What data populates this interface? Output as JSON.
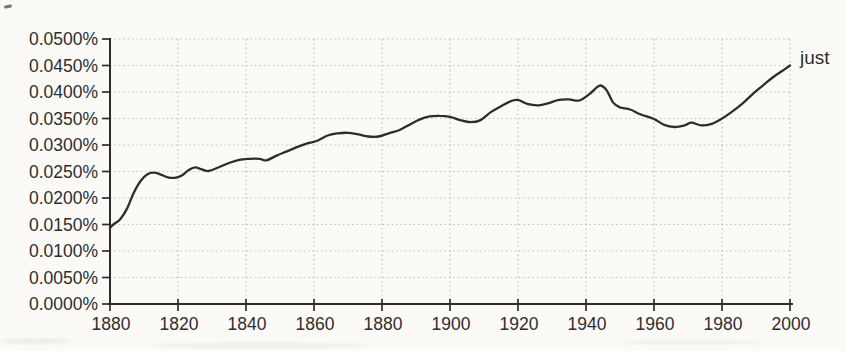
{
  "chart_data": {
    "type": "line",
    "title": "",
    "xlabel": "",
    "ylabel": "",
    "series_label": "just",
    "x_range": [
      1800,
      2000
    ],
    "y_range_percent": [
      0,
      0.05
    ],
    "grid": "dotted",
    "legend_position": "end-of-line-right",
    "x_tick_years": [
      1800,
      1820,
      1840,
      1860,
      1880,
      1900,
      1920,
      1940,
      1960,
      1980,
      2000
    ],
    "x_tick_labels": [
      "1880",
      "1820",
      "1840",
      "1860",
      "1880",
      "1900",
      "1920",
      "1940",
      "1960",
      "1980",
      "2000"
    ],
    "y_tick_values": [
      0.05,
      0.045,
      0.04,
      0.035,
      0.03,
      0.025,
      0.02,
      0.015,
      0.01,
      0.005,
      0.0
    ],
    "y_tick_labels": [
      "0.0500%",
      "0.0450%",
      "0.0400%",
      "0.0350%",
      "0.0300%",
      "0.0250%",
      "0.0200%",
      "0.0150%",
      "0.0100%",
      "0.0050%",
      "0.0000%"
    ],
    "series": [
      {
        "name": "just",
        "points": [
          [
            1800,
            0.0144
          ],
          [
            1801,
            0.015
          ],
          [
            1803,
            0.016
          ],
          [
            1805,
            0.018
          ],
          [
            1807,
            0.021
          ],
          [
            1809,
            0.0232
          ],
          [
            1811,
            0.0245
          ],
          [
            1813,
            0.0248
          ],
          [
            1815,
            0.0244
          ],
          [
            1817,
            0.0239
          ],
          [
            1819,
            0.0238
          ],
          [
            1821,
            0.0242
          ],
          [
            1823,
            0.0252
          ],
          [
            1825,
            0.0258
          ],
          [
            1827,
            0.0254
          ],
          [
            1829,
            0.0251
          ],
          [
            1832,
            0.0258
          ],
          [
            1835,
            0.0266
          ],
          [
            1838,
            0.0272
          ],
          [
            1841,
            0.0274
          ],
          [
            1844,
            0.0274
          ],
          [
            1846,
            0.0271
          ],
          [
            1849,
            0.028
          ],
          [
            1852,
            0.0288
          ],
          [
            1855,
            0.0296
          ],
          [
            1858,
            0.0303
          ],
          [
            1861,
            0.0308
          ],
          [
            1864,
            0.0318
          ],
          [
            1867,
            0.0322
          ],
          [
            1870,
            0.0323
          ],
          [
            1873,
            0.032
          ],
          [
            1876,
            0.0316
          ],
          [
            1879,
            0.0316
          ],
          [
            1882,
            0.0322
          ],
          [
            1885,
            0.0328
          ],
          [
            1888,
            0.0338
          ],
          [
            1891,
            0.0348
          ],
          [
            1894,
            0.0354
          ],
          [
            1897,
            0.0355
          ],
          [
            1900,
            0.0353
          ],
          [
            1903,
            0.0347
          ],
          [
            1906,
            0.0343
          ],
          [
            1909,
            0.0347
          ],
          [
            1912,
            0.0362
          ],
          [
            1915,
            0.0373
          ],
          [
            1918,
            0.0383
          ],
          [
            1920,
            0.0385
          ],
          [
            1923,
            0.0377
          ],
          [
            1926,
            0.0375
          ],
          [
            1929,
            0.0379
          ],
          [
            1932,
            0.0385
          ],
          [
            1935,
            0.0386
          ],
          [
            1938,
            0.0384
          ],
          [
            1941,
            0.0396
          ],
          [
            1944,
            0.0412
          ],
          [
            1946,
            0.0404
          ],
          [
            1948,
            0.038
          ],
          [
            1950,
            0.0371
          ],
          [
            1953,
            0.0367
          ],
          [
            1956,
            0.0358
          ],
          [
            1960,
            0.0349
          ],
          [
            1963,
            0.0338
          ],
          [
            1966,
            0.0334
          ],
          [
            1969,
            0.0337
          ],
          [
            1971,
            0.0342
          ],
          [
            1974,
            0.0337
          ],
          [
            1977,
            0.034
          ],
          [
            1980,
            0.035
          ],
          [
            1983,
            0.0363
          ],
          [
            1986,
            0.0378
          ],
          [
            1989,
            0.0396
          ],
          [
            1992,
            0.0412
          ],
          [
            1995,
            0.0428
          ],
          [
            1998,
            0.0441
          ],
          [
            2000,
            0.045
          ]
        ]
      }
    ]
  },
  "colors": {
    "background": "#fbfaf7",
    "line": "#2d2d2c",
    "axis": "#2c2c2b",
    "grid": "#b9b8b4",
    "text": "#2e2e2e"
  },
  "layout_values": {
    "plot_left": 110,
    "plot_right": 790,
    "plot_top": 39,
    "plot_bottom": 304
  }
}
